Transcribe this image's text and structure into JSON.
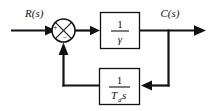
{
  "diagram": {
    "kind": "control-system-block-diagram",
    "background_color": "#ffffff",
    "line_color": "#111111",
    "input": {
      "label": "R(s)",
      "name": "reference-input"
    },
    "output": {
      "label": "C(s)",
      "name": "controlled-output"
    },
    "summing_junction": {
      "label": "summing-junction",
      "plus_sign": "+",
      "minus_sign": "−",
      "shape": "circle-with-cross"
    },
    "forward_block": {
      "numerator": "1",
      "denominator": "γ",
      "transfer_function": "1/γ"
    },
    "feedback_block": {
      "numerator": "1",
      "denominator_base": "T",
      "denominator_subscript": "d",
      "denominator_variable": "s",
      "transfer_function": "1/(Tₔs)"
    }
  }
}
